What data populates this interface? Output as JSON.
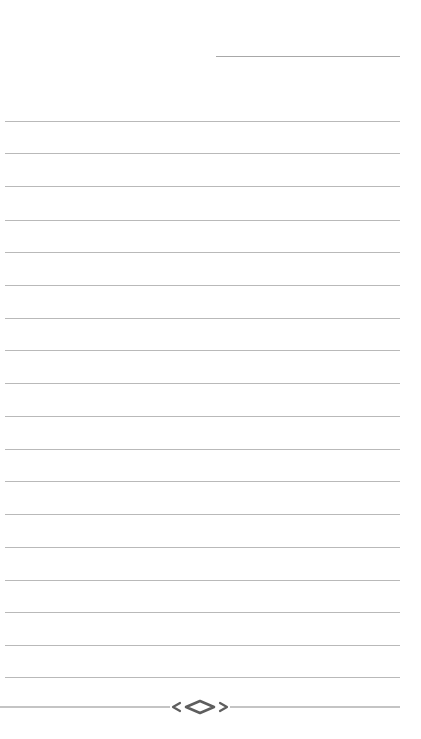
{
  "page": {
    "type": "lined-notepaper",
    "background_color": "#ffffff",
    "rule_color": "#b9b9b9",
    "ornament_color": "#6e6e6e"
  },
  "header_rule": {
    "x_start": 216,
    "x_end": 400,
    "y": 56
  },
  "rules": {
    "x_start": 5,
    "x_end": 400,
    "y_positions": [
      121,
      153,
      186,
      220,
      252,
      285,
      318,
      350,
      383,
      416,
      449,
      481,
      514,
      547,
      580,
      612,
      645,
      677
    ]
  },
  "footer": {
    "ornament_icon": "diamond-flourish-icon",
    "line_y": 707,
    "line_x_start": 0,
    "line_x_end": 400,
    "ornament_center_x": 200
  }
}
